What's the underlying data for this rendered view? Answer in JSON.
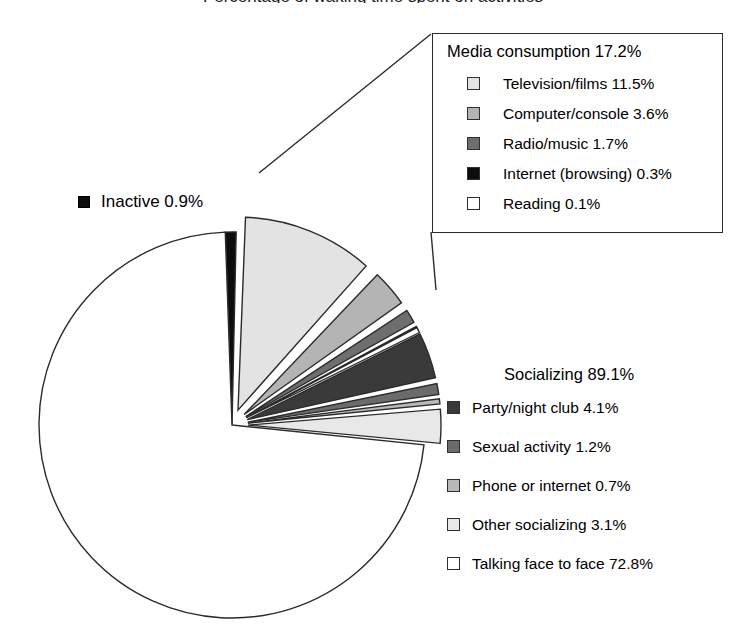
{
  "title_cropped": "Percentage of waking time spent on activities",
  "colors": {
    "outline": "#2b2b2b",
    "television": "#e3e3e3",
    "computer": "#b4b4b4",
    "radio": "#6e6e6e",
    "internet": "#0d0d0d",
    "reading": "#ffffff",
    "party": "#3a3a3a",
    "sexual": "#6b6b6b",
    "phone": "#b9b9b9",
    "other_socializing": "#e8e8e8",
    "talking": "#ffffff",
    "inactive": "#0d0d0d"
  },
  "inactive": {
    "label": "Inactive 0.9%",
    "swatch": "#0d0d0d",
    "value": 0.9
  },
  "media_box": {
    "title": "Media consumption 17.2%",
    "items": [
      {
        "label": "Television/films 11.5%",
        "swatch": "#e3e3e3",
        "value": 11.5
      },
      {
        "label": "Computer/console 3.6%",
        "swatch": "#b4b4b4",
        "value": 3.6
      },
      {
        "label": "Radio/music 1.7%",
        "swatch": "#6e6e6e",
        "value": 1.7
      },
      {
        "label": "Internet (browsing) 0.3%",
        "swatch": "#0d0d0d",
        "value": 0.3
      },
      {
        "label": "Reading 0.1%",
        "swatch": "#ffffff",
        "value": 0.1
      }
    ]
  },
  "social_legend": {
    "title": "Socializing 89.1%",
    "items": [
      {
        "label": "Party/night club 4.1%",
        "swatch": "#3a3a3a",
        "value": 4.1
      },
      {
        "label": "Sexual activity 1.2%",
        "swatch": "#6b6b6b",
        "value": 1.2
      },
      {
        "label": "Phone or internet 0.7%",
        "swatch": "#b9b9b9",
        "value": 0.7
      },
      {
        "label": "Other socializing 3.1%",
        "swatch": "#e8e8e8",
        "value": 3.1
      },
      {
        "label": "Talking face to face 72.8%",
        "swatch": "#ffffff",
        "value": 72.8
      }
    ]
  },
  "chart_data": {
    "type": "pie",
    "title": "Percentage of waking time spent on activities",
    "units": "percent",
    "total": 107.2,
    "groups": [
      {
        "name": "Media consumption",
        "value": 17.2,
        "exploded": true,
        "callout_box": true,
        "slices": [
          {
            "label": "Television/films",
            "value": 11.5,
            "color": "#e3e3e3"
          },
          {
            "label": "Computer/console",
            "value": 3.6,
            "color": "#b4b4b4"
          },
          {
            "label": "Radio/music",
            "value": 1.7,
            "color": "#6e6e6e"
          },
          {
            "label": "Internet (browsing)",
            "value": 0.3,
            "color": "#0d0d0d"
          },
          {
            "label": "Reading",
            "value": 0.1,
            "color": "#ffffff"
          }
        ]
      },
      {
        "name": "Socializing",
        "value": 89.1,
        "exploded": "partial",
        "callout_box": false,
        "slices": [
          {
            "label": "Party/night club",
            "value": 4.1,
            "color": "#3a3a3a",
            "exploded": true
          },
          {
            "label": "Sexual activity",
            "value": 1.2,
            "color": "#6b6b6b",
            "exploded": true
          },
          {
            "label": "Phone or internet",
            "value": 0.7,
            "color": "#b9b9b9",
            "exploded": true
          },
          {
            "label": "Other socializing",
            "value": 3.1,
            "color": "#e8e8e8",
            "exploded": true
          },
          {
            "label": "Talking face to face",
            "value": 72.8,
            "color": "#ffffff",
            "exploded": false
          }
        ]
      },
      {
        "name": "Inactive",
        "value": 0.9,
        "exploded": false,
        "callout_box": false,
        "slices": [
          {
            "label": "Inactive",
            "value": 0.9,
            "color": "#0d0d0d"
          }
        ]
      }
    ],
    "legend_position": "right",
    "grid": false
  }
}
